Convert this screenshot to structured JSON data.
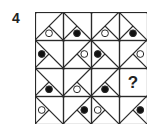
{
  "question": {
    "number": "4",
    "missing_symbol": "?"
  },
  "grid": {
    "rows": 4,
    "cols": 4,
    "line_color": "#2a2a2a",
    "black_fill": "#111111",
    "white_fill": "#ffffff",
    "cells": [
      [
        {
          "diagonal": "bl-tr",
          "triangle": "bottom",
          "circle": "white"
        },
        {
          "diagonal": "tl-br",
          "triangle": "bottom",
          "circle": "black"
        },
        {
          "diagonal": "bl-tr",
          "triangle": "bottom",
          "circle": "white"
        },
        {
          "diagonal": "tl-br",
          "triangle": "bottom",
          "circle": "black"
        }
      ],
      [
        {
          "diagonal": "tl-br",
          "triangle": "left",
          "circle": "black"
        },
        {
          "diagonal": "bl-tr",
          "triangle": "right",
          "circle": "white"
        },
        {
          "diagonal": "tl-br",
          "triangle": "left",
          "circle": "black"
        },
        {
          "diagonal": "bl-tr",
          "triangle": "right",
          "circle": "white"
        }
      ],
      [
        {
          "diagonal": "tl-br",
          "triangle": "bottom",
          "circle": "black"
        },
        {
          "diagonal": "bl-tr",
          "triangle": "bottom",
          "circle": "white"
        },
        {
          "diagonal": "bl-tr",
          "triangle": "bottom",
          "circle": "black"
        },
        {
          "missing": true,
          "label": "?"
        }
      ],
      [
        {
          "diagonal": "tl-br",
          "triangle": "left",
          "circle": "white"
        },
        {
          "diagonal": "bl-tr",
          "triangle": "right",
          "circle": "black"
        },
        {
          "diagonal": "tl-br",
          "triangle": "left",
          "circle": "white"
        },
        {
          "diagonal": "bl-tr",
          "triangle": "right",
          "circle": "black"
        }
      ]
    ]
  }
}
